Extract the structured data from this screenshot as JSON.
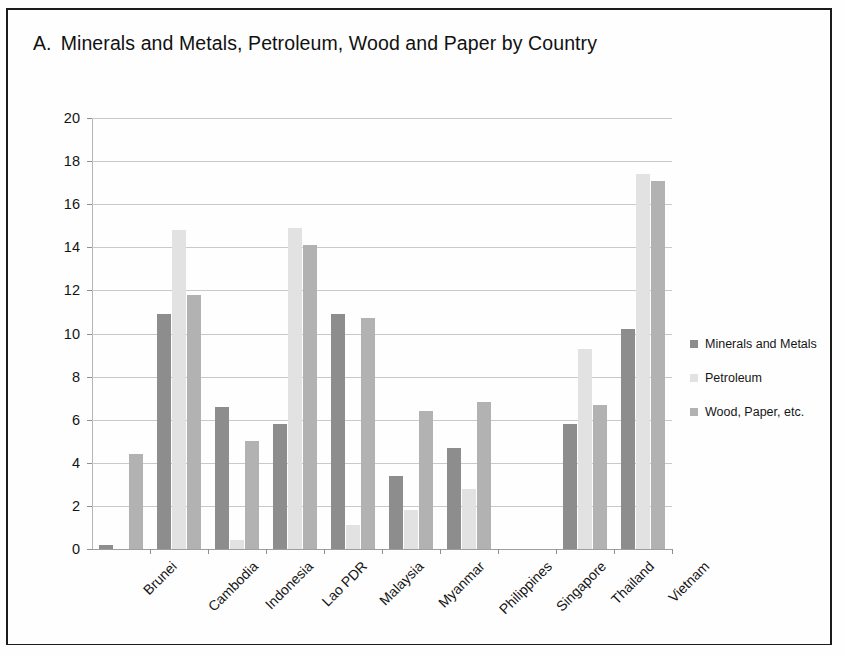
{
  "title": {
    "letter": "A.",
    "text": "Minerals and Metals, Petroleum, Wood and Paper by Country",
    "full": "A.  Minerals and Metals, Petroleum, Wood and Paper by Country"
  },
  "legend": {
    "items": [
      {
        "label": "Minerals and Metals",
        "color": "#8d8d8d",
        "swatch_icon": "legend-swatch-icon"
      },
      {
        "label": "Petroleum",
        "color": "#e2e2e2",
        "swatch_icon": "legend-swatch-icon"
      },
      {
        "label": "Wood, Paper, etc.",
        "color": "#b2b2b2",
        "swatch_icon": "legend-swatch-icon"
      }
    ]
  },
  "axis": {
    "y_ticks": [
      "0",
      "2",
      "4",
      "6",
      "8",
      "10",
      "12",
      "14",
      "16",
      "18",
      "20"
    ]
  },
  "chart_data": {
    "type": "bar",
    "xlabel": "",
    "ylabel": "",
    "ylim": [
      0,
      20
    ],
    "ytick_step": 2,
    "grid": true,
    "legend_position": "right",
    "categories": [
      "Brunei",
      "Cambodia",
      "Indonesia",
      "Lao PDR",
      "Malaysia",
      "Myanmar",
      "Philippines",
      "Singapore",
      "Thailand",
      "Vietnam"
    ],
    "series": [
      {
        "name": "Minerals and Metals",
        "color": "#8d8d8d",
        "values": [
          0.2,
          10.9,
          6.6,
          5.8,
          10.9,
          3.4,
          4.7,
          0,
          5.8,
          10.2
        ]
      },
      {
        "name": "Petroleum",
        "color": "#e2e2e2",
        "values": [
          0,
          14.8,
          0.4,
          14.9,
          1.1,
          1.8,
          2.8,
          0,
          9.3,
          17.4
        ]
      },
      {
        "name": "Wood, Paper, etc.",
        "color": "#b2b2b2",
        "values": [
          4.4,
          11.8,
          5.0,
          14.1,
          10.7,
          6.4,
          6.8,
          0,
          6.7,
          17.1
        ]
      }
    ]
  }
}
